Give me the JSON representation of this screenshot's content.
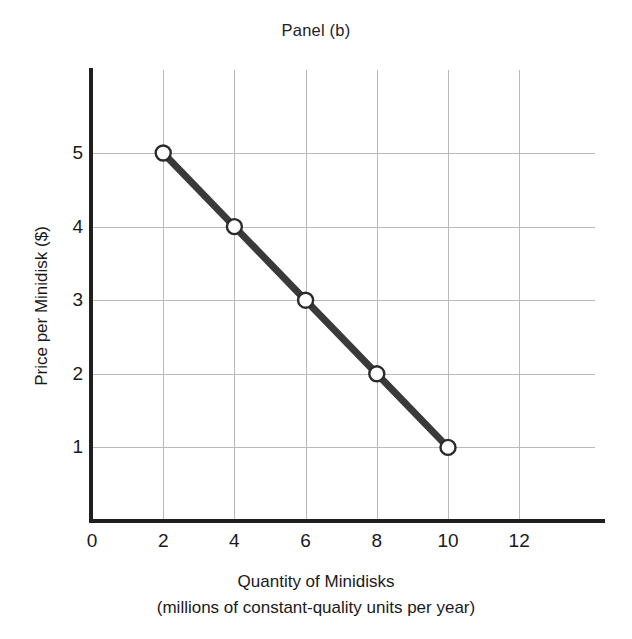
{
  "chart_data": {
    "type": "line",
    "title": "Panel (b)",
    "xlabel": "Quantity of Minidisks",
    "xlabel_line2": "(millions of constant-quality units per year)",
    "ylabel": "Price per Minidisk ($)",
    "xlim": [
      0,
      14.5
    ],
    "ylim": [
      0,
      6.15
    ],
    "xticks": [
      0,
      2,
      4,
      6,
      8,
      10,
      12
    ],
    "xtick_labels": [
      "0",
      "2",
      "4",
      "6",
      "8",
      "10",
      "12"
    ],
    "yticks": [
      1,
      2,
      3,
      4,
      5
    ],
    "ytick_labels": [
      "1",
      "2",
      "3",
      "4",
      "5"
    ],
    "grid": true,
    "legend": "none",
    "series": [
      {
        "name": "Demand for minidisks",
        "x": [
          2,
          4,
          6,
          8,
          10
        ],
        "y": [
          5,
          4,
          3,
          2,
          1
        ],
        "marker": "open-circle",
        "line_color": "#3a3a3a",
        "marker_face_color": "#ffffff",
        "marker_edge_color": "#2b2b2b",
        "line_width": 7
      }
    ],
    "points": [
      {
        "label": "A",
        "x": 2,
        "y": 5
      },
      {
        "label": "B",
        "x": 4,
        "y": 4
      },
      {
        "label": "C",
        "x": 6,
        "y": 3
      },
      {
        "label": "D",
        "x": 8,
        "y": 2
      },
      {
        "label": "E",
        "x": 10,
        "y": 1
      }
    ],
    "colors": {
      "axis": "#1f1f1f",
      "grid": "#b9b9b9",
      "line": "#3a3a3a",
      "background": "#ffffff",
      "text": "#1a1a1a"
    }
  }
}
